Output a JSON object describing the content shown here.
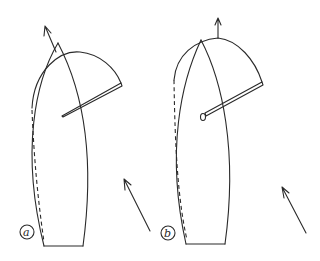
{
  "figure": {
    "panels": [
      {
        "id": "a",
        "label": "a",
        "description": "Boat with sail eased, boom out to leeward, heading arrow angled to port"
      },
      {
        "id": "b",
        "label": "b",
        "description": "Boat with sail trimmed, boom with ring at inboard end, heading arrow straight ahead"
      }
    ],
    "wind_arrows": 2,
    "colors": {
      "line": "#2a2a2a",
      "background": "#ffffff"
    }
  }
}
